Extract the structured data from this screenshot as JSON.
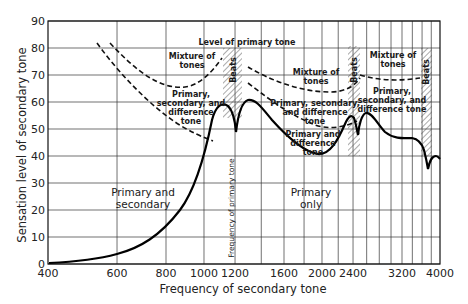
{
  "chart_data": {
    "type": "line",
    "title": "",
    "xlabel": "Frequency of secondary tone",
    "ylabel": "Sensation level of secondary tone",
    "x_scale": "log",
    "xlim": [
      400,
      4000
    ],
    "ylim": [
      0,
      90
    ],
    "x_ticks": [
      400,
      600,
      800,
      1000,
      1200,
      1600,
      2000,
      2400,
      3200,
      4000
    ],
    "x_tick_labels": [
      "400",
      "600",
      "800",
      "1000",
      "1200",
      "1600",
      "2000",
      "2400",
      "3200",
      "4000"
    ],
    "y_ticks": [
      0,
      10,
      20,
      30,
      40,
      50,
      60,
      70,
      80,
      90
    ],
    "y_tick_labels": [
      "0",
      "10",
      "20",
      "30",
      "40",
      "50",
      "60",
      "70",
      "80",
      "90"
    ],
    "grid": true,
    "series": [
      {
        "name": "Masking threshold (solid)",
        "style": "solid",
        "x": [
          400,
          500,
          600,
          700,
          800,
          900,
          1000,
          1050,
          1100,
          1150,
          1180,
          1200,
          1220,
          1260,
          1300,
          1400,
          1500,
          1600,
          1800,
          2000,
          2200,
          2300,
          2400,
          2450,
          2500,
          2600,
          2800,
          3000,
          3200,
          3400,
          3600,
          3750,
          3900,
          4000
        ],
        "values": [
          0,
          1.5,
          4,
          8,
          13,
          22,
          36,
          46,
          57,
          61,
          58,
          50,
          60,
          64,
          63,
          57,
          50,
          44,
          40,
          44,
          52,
          55,
          52,
          46,
          53,
          54,
          49,
          46,
          46,
          45,
          42,
          34,
          42,
          41
        ]
      },
      {
        "name": "Upper dashed boundary (Mixture of tones / Primary, secondary, and difference tone)",
        "style": "dashed",
        "x": [
          760,
          850,
          950,
          1050,
          1100
        ],
        "values": [
          80,
          72,
          67,
          68,
          72
        ]
      },
      {
        "name": "Lower dashed boundary (Primary, secondary, and difference tone / Primary only)",
        "style": "dashed",
        "x": [
          700,
          800,
          900,
          1000,
          1080
        ],
        "values": [
          80,
          68,
          58,
          51,
          47
        ]
      },
      {
        "name": "Upper dashed boundary right of 1200",
        "style": "dashed",
        "x": [
          1300,
          1500,
          1800,
          2100,
          2350
        ],
        "values": [
          70,
          66,
          63,
          62,
          66
        ]
      },
      {
        "name": "Lower dashed boundary right of 1200",
        "style": "dashed",
        "x": [
          1300,
          1500,
          1800,
          2000,
          2300
        ],
        "values": [
          64,
          56,
          50,
          49,
          50
        ]
      },
      {
        "name": "Upper dashed boundary right of 2400",
        "style": "dashed",
        "x": [
          2550,
          2800,
          3100,
          3400,
          3650
        ],
        "values": [
          71,
          69,
          68,
          68,
          69
        ]
      }
    ],
    "annotations": [
      {
        "text": "Level of primary tone",
        "x": 1200,
        "y": 74
      },
      {
        "text": "Frequency of primary tone",
        "x": 1200,
        "y": 25,
        "rotation": 90
      },
      {
        "text": "Beats",
        "x_range": [
          1100,
          1300
        ],
        "hatched": true,
        "rotation": 90
      },
      {
        "text": "Beats",
        "x_range": [
          2350,
          2550
        ],
        "hatched": true,
        "rotation": 90
      },
      {
        "text": "Beats",
        "x_range": [
          3700,
          4000
        ],
        "hatched": true,
        "rotation": 90
      },
      {
        "text": "Mixture of tones",
        "region": "upper-left"
      },
      {
        "text": "Primary, secondary, and difference tone",
        "region": "left-middle"
      },
      {
        "text": "Mixture of tones",
        "region": "upper-middle"
      },
      {
        "text": "Primary, secondary, and difference tone",
        "region": "middle"
      },
      {
        "text": "Primary and difference tone",
        "region": "middle-lower"
      },
      {
        "text": "Mixture of tones",
        "region": "upper-right"
      },
      {
        "text": "Primary, secondary, and difference tone",
        "region": "right"
      },
      {
        "text": "Primary and secondary",
        "region": "lower-left"
      },
      {
        "text": "Primary only",
        "region": "lower-middle"
      }
    ],
    "legend": null
  },
  "labels": {
    "xlabel": "Frequency of secondary tone",
    "ylabel": "Sensation level of secondary tone",
    "level_primary": "Level of primary tone",
    "freq_primary": "Frequency of primary tone",
    "beats": "Beats",
    "mixture_1": "Mixture of",
    "mixture_2": "tones",
    "psd_1": "Primary,",
    "psd_2": "secondary, and",
    "psd_3": "difference",
    "psd_4": "tone",
    "psd_mid_1": "Primary, secondary,",
    "psd_mid_2": "and difference",
    "psd_mid_3": "tone",
    "pd_1": "Primary and",
    "pd_2": "difference",
    "pd_3": "tone",
    "psd_right_1": "Primary,",
    "psd_right_2": "secondary, and",
    "psd_right_3": "difference tone",
    "ps_1": "Primary and",
    "ps_2": "secondary",
    "po_1": "Primary",
    "po_2": "only"
  },
  "ticks": {
    "x": [
      "400",
      "600",
      "800",
      "1000",
      "1200",
      "1600",
      "2000",
      "2400",
      "3200",
      "4000"
    ],
    "y": [
      "0",
      "10",
      "20",
      "30",
      "40",
      "50",
      "60",
      "70",
      "80",
      "90"
    ]
  }
}
